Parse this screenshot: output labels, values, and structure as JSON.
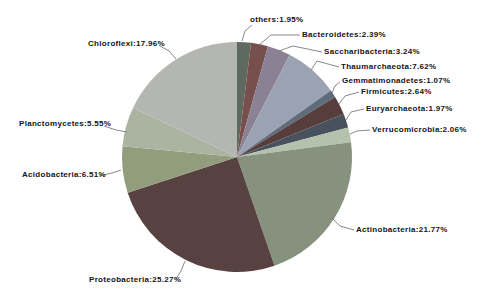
{
  "chart_data": {
    "type": "pie",
    "title": "",
    "legend": "none",
    "background": "#ffffff",
    "start_angle_deg": 0,
    "direction": "clockwise",
    "center": {
      "cx": 237,
      "cy": 157,
      "radius": 115
    },
    "slices": [
      {
        "name": "others",
        "value": 1.95,
        "label": "others:1.95%",
        "color": "#5e6a5f"
      },
      {
        "name": "Bacteroidetes",
        "value": 2.39,
        "label": "Bacteroidetes:2.39%",
        "color": "#774f4d"
      },
      {
        "name": "Saccharibacteria",
        "value": 3.24,
        "label": "Saccharibacteria:3.24%",
        "color": "#8b8194"
      },
      {
        "name": "Thaumarchaeota",
        "value": 7.62,
        "label": "Thaumarchaeota:7.62%",
        "color": "#9ba3b2"
      },
      {
        "name": "Gemmatimonadetes",
        "value": 1.07,
        "label": "Gemmatimonadetes:1.07%",
        "color": "#5e6c7c"
      },
      {
        "name": "Firmicutes",
        "value": 2.64,
        "label": "Firmicutes:2.64%",
        "color": "#573e3d"
      },
      {
        "name": "Euryarchaeota",
        "value": 1.97,
        "label": "Euryarchaeota:1.97%",
        "color": "#48525f"
      },
      {
        "name": "Verrucomicrobia",
        "value": 2.06,
        "label": "Verrucomicrobia:2.06%",
        "color": "#b4c1ac"
      },
      {
        "name": "Actinobacteria",
        "value": 21.77,
        "label": "Actinobacteria:21.77%",
        "color": "#86917e"
      },
      {
        "name": "Proteobacteria",
        "value": 25.27,
        "label": "Proteobacteria:25.27%",
        "color": "#584241"
      },
      {
        "name": "Acidobacteria",
        "value": 6.51,
        "label": "Acidobacteria:6.51%",
        "color": "#929d7e"
      },
      {
        "name": "Planctomycetes",
        "value": 5.55,
        "label": "Planctomycetes:5.55%",
        "color": "#abb4a1"
      },
      {
        "name": "Chloroflexi",
        "value": 17.96,
        "label": "Chloroflexi:17.96%",
        "color": "#b4b6b2"
      }
    ]
  }
}
